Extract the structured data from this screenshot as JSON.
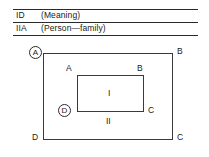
{
  "table": {
    "rows": [
      {
        "id": "ID",
        "meaning": "(Meaning)"
      },
      {
        "id": "IIA",
        "meaning": "(Person—family)"
      }
    ]
  },
  "diagram": {
    "outer_rectangle": {
      "corners": {
        "top_left": "A",
        "top_right": "B",
        "bottom_right": "C",
        "bottom_left": "D"
      }
    },
    "inner_rectangle": {
      "corners": {
        "top_left": "A",
        "top_right": "B",
        "bottom_right": "C",
        "bottom_left": "D"
      }
    },
    "regions": {
      "inner": "I",
      "outer": "II"
    }
  }
}
